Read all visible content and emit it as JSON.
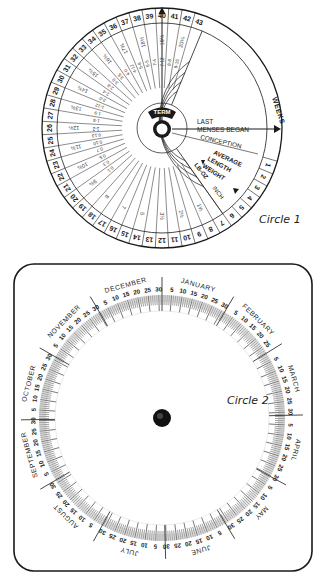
{
  "circle1": {
    "caption": "Circle 1",
    "center_label": "TERM",
    "pointer_labels": {
      "last_menses": [
        "LAST",
        "MENSES BEGAN"
      ],
      "conception": "CONCEPTION",
      "average": "AVERAGE",
      "length": "LENGTH",
      "weight": "WEIGHT",
      "lb_oz": "LB-OZ",
      "inch": "INCH",
      "weeks": "WEEKS"
    },
    "week_numbers": [
      1,
      2,
      3,
      4,
      5,
      6,
      7,
      8,
      9,
      10,
      11,
      12,
      13,
      14,
      15,
      16,
      17,
      18,
      19,
      20,
      21,
      22,
      23,
      24,
      25,
      26,
      27,
      28,
      29,
      30,
      31,
      32,
      33,
      34,
      35,
      36,
      37,
      38,
      39,
      40,
      41,
      42,
      43
    ],
    "length_inches": [
      "1½",
      "2½",
      "3½",
      "5",
      "7",
      "8",
      "9¾",
      "10¾",
      "11¾",
      "12¾",
      "13¾",
      "14¾",
      "15¾",
      "16¾",
      "17¾",
      "18½",
      "19½",
      "20¼"
    ],
    "weights_lb_oz": [
      "0.1",
      "0.3",
      "0.5",
      "0.7",
      "0.10",
      "0.13",
      "1-2",
      "1-5",
      "1-9",
      "1-12",
      "2-0",
      "2-4",
      "2-8",
      "3-0",
      "3-5",
      "4-0",
      "4-12",
      "5-8",
      "6-5",
      "7-4",
      "7-12",
      "8-8",
      "8-15"
    ]
  },
  "circle2": {
    "caption": "Circle 2",
    "months": [
      {
        "name": "JANUARY",
        "days": 31
      },
      {
        "name": "FEBRUARY",
        "days": 28
      },
      {
        "name": "MARCH",
        "days": 31
      },
      {
        "name": "APRIL",
        "days": 30
      },
      {
        "name": "MAY",
        "days": 31
      },
      {
        "name": "JUNE",
        "days": 30
      },
      {
        "name": "JULY",
        "days": 31
      },
      {
        "name": "AUGUST",
        "days": 31
      },
      {
        "name": "SEPTEMBER",
        "days": 30
      },
      {
        "name": "OCTOBER",
        "days": 31
      },
      {
        "name": "NOVEMBER",
        "days": 30
      },
      {
        "name": "DECEMBER",
        "days": 31
      }
    ],
    "day_marks": [
      5,
      10,
      15,
      20,
      25,
      30
    ]
  },
  "colors": {
    "ink": "#1a1a1a",
    "paper": "#ffffff",
    "tick": "#555555"
  }
}
